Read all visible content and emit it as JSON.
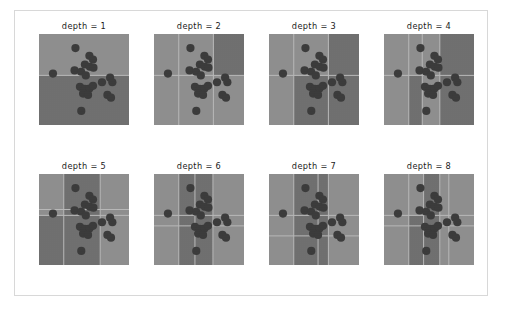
{
  "figure": {
    "background_color": "#ffffff",
    "frame_color": "#d8d8d8",
    "width": 505,
    "height": 311
  },
  "chart_data": {
    "type": "scatter",
    "title": "",
    "subtitle": "",
    "xlabel": "",
    "ylabel": "",
    "grid": false,
    "legend": "none",
    "xlim": [
      0,
      1
    ],
    "ylim": [
      0,
      1
    ],
    "panel_layout": {
      "rows": 2,
      "cols": 4
    },
    "region_colors": {
      "class_light": "#8e8e8e",
      "class_dark": "#6f6f6f",
      "boundary_line": "#b9b9b9"
    },
    "point_color": "#3a3a3a",
    "point_radius_px": 4.1,
    "points": [
      {
        "x": 0.405,
        "y": 0.845
      },
      {
        "x": 0.155,
        "y": 0.565
      },
      {
        "x": 0.395,
        "y": 0.6
      },
      {
        "x": 0.56,
        "y": 0.76
      },
      {
        "x": 0.6,
        "y": 0.72
      },
      {
        "x": 0.51,
        "y": 0.665
      },
      {
        "x": 0.565,
        "y": 0.64
      },
      {
        "x": 0.605,
        "y": 0.63
      },
      {
        "x": 0.468,
        "y": 0.585
      },
      {
        "x": 0.52,
        "y": 0.545
      },
      {
        "x": 0.455,
        "y": 0.42
      },
      {
        "x": 0.51,
        "y": 0.398
      },
      {
        "x": 0.56,
        "y": 0.4
      },
      {
        "x": 0.6,
        "y": 0.43
      },
      {
        "x": 0.7,
        "y": 0.47
      },
      {
        "x": 0.79,
        "y": 0.52
      },
      {
        "x": 0.815,
        "y": 0.47
      },
      {
        "x": 0.49,
        "y": 0.345
      },
      {
        "x": 0.545,
        "y": 0.33
      },
      {
        "x": 0.76,
        "y": 0.33
      },
      {
        "x": 0.8,
        "y": 0.3
      },
      {
        "x": 0.47,
        "y": 0.155
      }
    ],
    "panels": [
      {
        "title": "depth = 1",
        "depth": 1,
        "splits": [
          {
            "orientation": "horizontal",
            "position": 0.545
          }
        ],
        "regions": [
          {
            "x0": 0.0,
            "y0": 0.545,
            "x1": 1.0,
            "y1": 1.0,
            "fill": "class_light"
          },
          {
            "x0": 0.0,
            "y0": 0.0,
            "x1": 1.0,
            "y1": 0.545,
            "fill": "class_dark"
          }
        ]
      },
      {
        "title": "depth = 2",
        "depth": 2,
        "splits": [
          {
            "orientation": "vertical",
            "position": 0.275
          },
          {
            "orientation": "vertical",
            "position": 0.66
          },
          {
            "orientation": "horizontal",
            "position": 0.545
          }
        ],
        "regions": [
          {
            "x0": 0.0,
            "y0": 0.0,
            "x1": 0.275,
            "y1": 1.0,
            "fill": "class_light"
          },
          {
            "x0": 0.275,
            "y0": 0.0,
            "x1": 1.0,
            "y1": 1.0,
            "fill": "class_light"
          },
          {
            "x0": 0.66,
            "y0": 0.545,
            "x1": 1.0,
            "y1": 1.0,
            "fill": "class_dark"
          }
        ]
      },
      {
        "title": "depth = 3",
        "depth": 3,
        "splits": [
          {
            "orientation": "vertical",
            "position": 0.275
          },
          {
            "orientation": "vertical",
            "position": 0.66
          },
          {
            "orientation": "horizontal",
            "position": 0.545
          }
        ],
        "regions": [
          {
            "x0": 0.0,
            "y0": 0.0,
            "x1": 0.275,
            "y1": 1.0,
            "fill": "class_light"
          },
          {
            "x0": 0.275,
            "y0": 0.0,
            "x1": 1.0,
            "y1": 0.545,
            "fill": "class_dark"
          },
          {
            "x0": 0.66,
            "y0": 0.545,
            "x1": 1.0,
            "y1": 1.0,
            "fill": "class_dark"
          }
        ]
      },
      {
        "title": "depth = 4",
        "depth": 4,
        "splits": [
          {
            "orientation": "vertical",
            "position": 0.275
          },
          {
            "orientation": "vertical",
            "position": 0.425
          },
          {
            "orientation": "vertical",
            "position": 0.62
          },
          {
            "orientation": "horizontal",
            "position": 0.545
          }
        ],
        "regions": [
          {
            "x0": 0.0,
            "y0": 0.0,
            "x1": 0.275,
            "y1": 1.0,
            "fill": "class_light"
          },
          {
            "x0": 0.275,
            "y0": 0.0,
            "x1": 0.425,
            "y1": 0.545,
            "fill": "class_dark"
          },
          {
            "x0": 0.425,
            "y0": 0.0,
            "x1": 0.62,
            "y1": 0.545,
            "fill": "class_light"
          },
          {
            "x0": 0.62,
            "y0": 0.0,
            "x1": 1.0,
            "y1": 1.0,
            "fill": "class_dark"
          }
        ]
      },
      {
        "title": "depth = 5",
        "depth": 5,
        "splits": [
          {
            "orientation": "vertical",
            "position": 0.275
          },
          {
            "orientation": "vertical",
            "position": 0.68
          },
          {
            "orientation": "horizontal",
            "position": 0.545
          },
          {
            "orientation": "horizontal",
            "position": 0.61
          }
        ],
        "regions": [
          {
            "x0": 0.0,
            "y0": 0.545,
            "x1": 0.275,
            "y1": 1.0,
            "fill": "class_light"
          },
          {
            "x0": 0.0,
            "y0": 0.0,
            "x1": 0.275,
            "y1": 0.545,
            "fill": "class_dark"
          },
          {
            "x0": 0.275,
            "y0": 0.0,
            "x1": 0.68,
            "y1": 1.0,
            "fill": "class_dark"
          },
          {
            "x0": 0.68,
            "y0": 0.61,
            "x1": 1.0,
            "y1": 1.0,
            "fill": "class_light"
          }
        ]
      },
      {
        "title": "depth = 6",
        "depth": 6,
        "splits": [
          {
            "orientation": "vertical",
            "position": 0.275
          },
          {
            "orientation": "vertical",
            "position": 0.455
          },
          {
            "orientation": "vertical",
            "position": 0.655
          },
          {
            "orientation": "horizontal",
            "position": 0.545
          },
          {
            "orientation": "horizontal",
            "position": 0.43
          }
        ],
        "regions": [
          {
            "x0": 0.0,
            "y0": 0.0,
            "x1": 0.275,
            "y1": 1.0,
            "fill": "class_light"
          },
          {
            "x0": 0.275,
            "y0": 0.0,
            "x1": 0.455,
            "y1": 1.0,
            "fill": "class_dark"
          },
          {
            "x0": 0.455,
            "y0": 0.0,
            "x1": 0.655,
            "y1": 1.0,
            "fill": "class_dark"
          },
          {
            "x0": 0.655,
            "y0": 0.545,
            "x1": 1.0,
            "y1": 1.0,
            "fill": "class_light"
          }
        ]
      },
      {
        "title": "depth = 7",
        "depth": 7,
        "splits": [
          {
            "orientation": "vertical",
            "position": 0.275
          },
          {
            "orientation": "vertical",
            "position": 0.545
          },
          {
            "orientation": "vertical",
            "position": 0.66
          },
          {
            "orientation": "horizontal",
            "position": 0.545
          },
          {
            "orientation": "horizontal",
            "position": 0.32
          }
        ],
        "regions": [
          {
            "x0": 0.0,
            "y0": 0.0,
            "x1": 0.275,
            "y1": 1.0,
            "fill": "class_light"
          },
          {
            "x0": 0.275,
            "y0": 0.0,
            "x1": 0.545,
            "y1": 1.0,
            "fill": "class_dark"
          },
          {
            "x0": 0.545,
            "y0": 0.0,
            "x1": 0.66,
            "y1": 1.0,
            "fill": "class_dark"
          },
          {
            "x0": 0.66,
            "y0": 0.545,
            "x1": 1.0,
            "y1": 1.0,
            "fill": "class_light"
          }
        ]
      },
      {
        "title": "depth = 8",
        "depth": 8,
        "splits": [
          {
            "orientation": "vertical",
            "position": 0.275
          },
          {
            "orientation": "vertical",
            "position": 0.44
          },
          {
            "orientation": "vertical",
            "position": 0.62
          },
          {
            "orientation": "vertical",
            "position": 0.72
          },
          {
            "orientation": "horizontal",
            "position": 0.545
          },
          {
            "orientation": "horizontal",
            "position": 0.43
          }
        ],
        "regions": [
          {
            "x0": 0.0,
            "y0": 0.0,
            "x1": 0.275,
            "y1": 1.0,
            "fill": "class_light"
          },
          {
            "x0": 0.275,
            "y0": 0.0,
            "x1": 0.44,
            "y1": 0.545,
            "fill": "class_dark"
          },
          {
            "x0": 0.44,
            "y0": 0.0,
            "x1": 0.62,
            "y1": 1.0,
            "fill": "class_dark"
          },
          {
            "x0": 0.62,
            "y0": 0.43,
            "x1": 1.0,
            "y1": 1.0,
            "fill": "class_light"
          }
        ]
      }
    ]
  }
}
